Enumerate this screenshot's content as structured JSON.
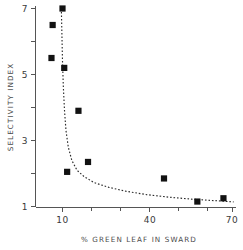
{
  "chart_data": {
    "type": "scatter",
    "title": "",
    "subtitle": "",
    "xlabel": "% GREEN LEAF IN SWARD",
    "ylabel": "SELECTIVITY INDEX",
    "xlim": [
      5,
      70
    ],
    "ylim": [
      0,
      7
    ],
    "grid": false,
    "legend": null,
    "x_ticks_major": [
      10,
      40,
      70
    ],
    "x_tick_labels": [
      "10",
      "40",
      "70"
    ],
    "x_ticks_minor": [
      20,
      30,
      50,
      60
    ],
    "y_ticks_major": [
      1,
      3,
      5,
      7
    ],
    "y_tick_labels": [
      "1",
      "3",
      "5",
      "7"
    ],
    "y_ticks_minor": [
      2,
      4,
      6
    ],
    "marker": "filled-square",
    "marker_color": "#121212",
    "points": [
      {
        "x": 10.0,
        "y": 7.0
      },
      {
        "x": 6.6,
        "y": 6.5
      },
      {
        "x": 6.2,
        "y": 5.5
      },
      {
        "x": 10.6,
        "y": 5.2
      },
      {
        "x": 15.5,
        "y": 3.9
      },
      {
        "x": 18.8,
        "y": 2.35
      },
      {
        "x": 11.6,
        "y": 2.05
      },
      {
        "x": 45.0,
        "y": 1.85
      },
      {
        "x": 56.5,
        "y": 1.15
      },
      {
        "x": 65.5,
        "y": 1.25
      }
    ],
    "fit_curve": {
      "style": "dashed",
      "color": "#2b2b2b",
      "description": "hyperbolic decay fitted through the scatter",
      "points": [
        {
          "x": 9.6,
          "y": 7.0
        },
        {
          "x": 9.8,
          "y": 6.2
        },
        {
          "x": 10.0,
          "y": 5.4
        },
        {
          "x": 10.3,
          "y": 4.6
        },
        {
          "x": 10.7,
          "y": 3.9
        },
        {
          "x": 11.2,
          "y": 3.3
        },
        {
          "x": 12.0,
          "y": 2.8
        },
        {
          "x": 13.2,
          "y": 2.4
        },
        {
          "x": 15.0,
          "y": 2.1
        },
        {
          "x": 17.5,
          "y": 1.9
        },
        {
          "x": 21.0,
          "y": 1.72
        },
        {
          "x": 26.0,
          "y": 1.58
        },
        {
          "x": 32.0,
          "y": 1.46
        },
        {
          "x": 39.0,
          "y": 1.36
        },
        {
          "x": 47.0,
          "y": 1.28
        },
        {
          "x": 55.0,
          "y": 1.22
        },
        {
          "x": 62.0,
          "y": 1.18
        },
        {
          "x": 69.0,
          "y": 1.14
        }
      ]
    }
  },
  "axes": {
    "x_title": "% GREEN LEAF IN SWARD",
    "y_title": "SELECTIVITY INDEX"
  }
}
